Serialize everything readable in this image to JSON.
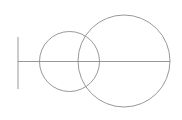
{
  "figure": {
    "background_color": "#ffffff",
    "stroke_color": "#8c8c8c",
    "stroke_width": 0.9,
    "canvas": {
      "width": 182,
      "height": 120
    }
  },
  "chart_data": {
    "type": "diagram",
    "xlabel": "",
    "ylabel": "",
    "xlim": [
      0,
      182
    ],
    "ylim": [
      0,
      120
    ],
    "grid": false,
    "legend": "none",
    "shapes": [
      {
        "name": "small-circle",
        "type": "circle",
        "cx": 69.5,
        "cy": 61.5,
        "r": 30,
        "fill": "none",
        "stroke": "#8c8c8c"
      },
      {
        "name": "large-circle",
        "type": "circle",
        "cx": 124,
        "cy": 61,
        "r": 46,
        "fill": "none",
        "stroke": "#8c8c8c"
      },
      {
        "name": "horizontal-axis",
        "type": "line",
        "x1": 18,
        "y1": 61.5,
        "x2": 170,
        "y2": 61.5,
        "stroke": "#8c8c8c"
      },
      {
        "name": "left-end-tick",
        "type": "line",
        "x1": 18,
        "y1": 37,
        "x2": 18,
        "y2": 89,
        "stroke": "#8c8c8c"
      }
    ],
    "annotations": []
  }
}
